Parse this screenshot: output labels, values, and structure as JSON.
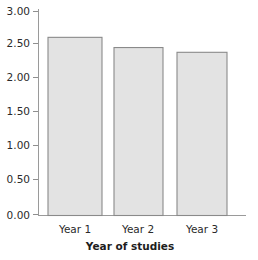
{
  "chart_data": {
    "type": "bar",
    "title": "",
    "subtitle": "",
    "xlabel": "Year of studies",
    "ylabel": "",
    "categories": [
      "Year 1",
      "Year 2",
      "Year 3"
    ],
    "values": [
      2.62,
      2.47,
      2.4
    ],
    "ylim": [
      0.0,
      3.0
    ],
    "ytick_values": [
      0.0,
      0.5,
      1.0,
      1.5,
      2.0,
      2.5,
      3.0
    ],
    "ytick_labels": [
      "0.00",
      "0.50",
      "1.00",
      "1.50",
      "2.00",
      "2.50",
      "3.00"
    ],
    "grid": false,
    "legend": null,
    "legend_position": "none",
    "bar_fill_color": "#e3e3e3",
    "bar_border_color": "#8a8a8a",
    "axis_color": "#9a9a9a",
    "text_color": "#2a2a2a",
    "background_color": "#ffffff"
  },
  "axes": {
    "y": {
      "ticks": [
        {
          "label": "3.00",
          "value": 3.0
        },
        {
          "label": "2.50",
          "value": 2.5
        },
        {
          "label": "2.00",
          "value": 2.0
        },
        {
          "label": "1.50",
          "value": 1.5
        },
        {
          "label": "1.00",
          "value": 1.0
        },
        {
          "label": "0.50",
          "value": 0.5
        },
        {
          "label": "0.00",
          "value": 0.0
        }
      ]
    },
    "x": {
      "title": "Year of studies",
      "ticks": [
        {
          "label": "Year 1"
        },
        {
          "label": "Year 2"
        },
        {
          "label": "Year 3"
        }
      ]
    }
  },
  "bars": [
    {
      "label": "Year 1",
      "value": 2.62
    },
    {
      "label": "Year 2",
      "value": 2.47
    },
    {
      "label": "Year 3",
      "value": 2.4
    }
  ]
}
